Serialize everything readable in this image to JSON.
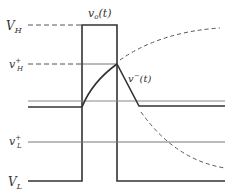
{
  "labels": {
    "vo": "v",
    "vo_sub": "o",
    "vo_arg": "(t)",
    "VH": "V",
    "VH_sub": "H",
    "vHplus": "v",
    "vHplus_sup": "+",
    "vHplus_sub": "H",
    "vminus": "v",
    "vminus_sup": "−",
    "vminus_arg": "(t)",
    "vLplus": "v",
    "vLplus_sup": "+",
    "vLplus_sub": "L",
    "VL": "V",
    "VL_sub": "L"
  },
  "colors": {
    "stroke_dark": "#333333",
    "stroke_gray": "#888888",
    "dashed": "#555555"
  }
}
